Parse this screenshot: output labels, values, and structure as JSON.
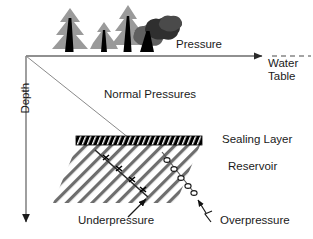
{
  "figure": {
    "type": "geological-cross-section-diagram",
    "axes": {
      "x_axis": {
        "label": "Pressure",
        "direction": "right",
        "arrow": true
      },
      "y_axis": {
        "label": "Depth",
        "direction": "down",
        "arrow": true,
        "rotated": true
      }
    },
    "labels": {
      "pressure": "Pressure",
      "water_table": "Water Table",
      "normal_pressures": "Normal Pressures",
      "sealing_layer": "Sealing Layer",
      "reservoir": "Reservoir",
      "underpressure": "Underpressure",
      "overpressure": "Overpressure",
      "depth": "Depth"
    },
    "elements": {
      "trees": [
        {
          "name": "conifer-tree-1",
          "kind": "conifer",
          "x": 70,
          "size": "large"
        },
        {
          "name": "conifer-tree-2",
          "kind": "conifer",
          "x": 104,
          "size": "small"
        },
        {
          "name": "conifer-tree-3",
          "kind": "conifer",
          "x": 128,
          "size": "medium"
        },
        {
          "name": "deciduous-tree-1",
          "kind": "deciduous",
          "x": 148,
          "size": "large"
        }
      ],
      "normal_pressure_gradient_line": {
        "from": [
          26,
          56
        ],
        "to": [
          133,
          141
        ]
      },
      "sealing_layer_band": {
        "x": 76,
        "y": 136,
        "width": 125,
        "height": 9,
        "fill": "#000000",
        "hatch": "#ffffff"
      },
      "reservoir_body": {
        "hatch_direction": "diagonal-down-left",
        "hatch_color": "#6e6e6e"
      },
      "underpressure_curve": {
        "marker": "plus",
        "marker_count": 4
      },
      "overpressure_curve": {
        "marker": "circle",
        "marker_count": 5
      }
    },
    "colors": {
      "ink": "#1a1a1a",
      "axis": "#6b6b6b",
      "tree_foliage_light": "#9a9a9a",
      "tree_foliage_dark": "#3a3a3a",
      "trunk": "#000000",
      "hatch": "#6e6e6e",
      "background": "#ffffff"
    }
  }
}
